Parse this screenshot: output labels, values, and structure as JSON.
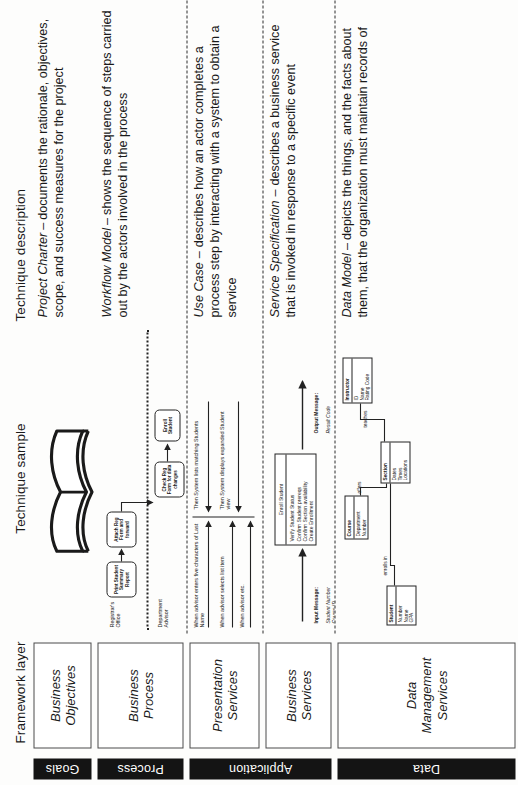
{
  "headers": {
    "domain_col": "",
    "framework_layer": "Framework layer",
    "technique_sample": "Technique sample",
    "technique_description": "Technique description"
  },
  "domains": [
    {
      "label": "Goals"
    },
    {
      "label": "Process"
    },
    {
      "label": "Application"
    },
    {
      "label": "Data"
    }
  ],
  "rows": [
    {
      "framework_layer": "Business\nObjectives",
      "technique_name": "Project Charter",
      "technique_dash": "–",
      "description": "documents the rationale, objectives, scope, and success measures for the project",
      "sample_type": "book-icon"
    },
    {
      "framework_layer": "Business\nProcess",
      "technique_name": "Workflow Model",
      "technique_dash": "–",
      "description": "shows the sequence of steps carried out by the actors involved in the process",
      "sample_type": "workflow-diagram"
    },
    {
      "framework_layer": "Presentation\nServices",
      "technique_name": "Use Case",
      "technique_dash": "–",
      "description": "describes how an actor completes a process step by interacting with a system to obtain a service",
      "sample_type": "use-case-diagram"
    },
    {
      "framework_layer": "Business\nServices",
      "technique_name": "Service Specification",
      "technique_dash": "–",
      "description": "describes a business service that is invoked in response to a specific event",
      "sample_type": "service-spec-diagram"
    },
    {
      "framework_layer": "Data\nManagement\nServices",
      "technique_name": "Data Model",
      "technique_dash": "–",
      "description": "depicts the things, and the facts about them, that the organization must maintain records of",
      "sample_type": "data-model-diagram"
    }
  ],
  "workflow": {
    "lanes": [
      "Registrar's\nOffice",
      "Department\nAdvisor"
    ],
    "steps": [
      "Print Student Summary Report",
      "Attach Reg Form and forward",
      "Check Reg Form for data changes",
      "Enroll Student"
    ]
  },
  "use_case": {
    "left_steps": [
      "When advisor enters five characters of Last Name",
      "When advisor selects list item",
      "When advisor etc."
    ],
    "right_steps": [
      "Then System lists matching Students",
      "Then System displays expanded Student view"
    ]
  },
  "service_spec": {
    "name": "Enroll Student",
    "operations": "Verify Student Status\nConfirm Student prereqs\nConfirm Section availability\nCreate Enrollment",
    "input_label": "Input Message:",
    "input_fields": "Student Number\nCourse ID\nSection ID",
    "output_label": "Output Message:",
    "output_fields": "Result Code"
  },
  "data_model": {
    "entities": [
      {
        "name": "Instructor",
        "attributes": "ID\nName\nRating Code"
      },
      {
        "name": "Course",
        "attributes": "Department\nNumber"
      },
      {
        "name": "Section",
        "attributes": "Dates\nTimes\nLocations"
      },
      {
        "name": "Student",
        "attributes": "Number\nName\nGPA"
      }
    ],
    "relationships": [
      "teaches",
      "offers",
      "enrolls in"
    ]
  },
  "colors": {
    "domain_bar": "#141414",
    "domain_text": "#ffffff",
    "box_border": "#4a4a4a",
    "dashed_separator": "#2b2b2b",
    "page_background": "#fdfdfc"
  }
}
